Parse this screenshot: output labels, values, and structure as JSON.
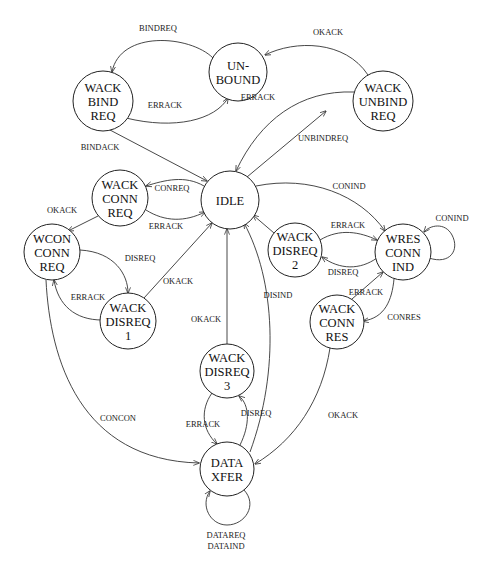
{
  "diagram": {
    "title": "",
    "type": "state-transition",
    "nodes": [
      {
        "id": "unbound",
        "lines": [
          "UN-",
          "BOUND"
        ],
        "cx": 238,
        "cy": 72,
        "r": 29
      },
      {
        "id": "wack_bind_req",
        "lines": [
          "WACK",
          "BIND",
          "REQ"
        ],
        "cx": 103,
        "cy": 101,
        "r": 30
      },
      {
        "id": "wack_unbind_req",
        "lines": [
          "WACK",
          "UNBIND",
          "REQ"
        ],
        "cx": 383,
        "cy": 101,
        "r": 30
      },
      {
        "id": "idle",
        "lines": [
          "IDLE"
        ],
        "cx": 230,
        "cy": 200,
        "r": 29
      },
      {
        "id": "wack_conn_req",
        "lines": [
          "WACK",
          "CONN",
          "REQ"
        ],
        "cx": 120,
        "cy": 198,
        "r": 28
      },
      {
        "id": "wcon_conn_req",
        "lines": [
          "WCON",
          "CONN",
          "REQ"
        ],
        "cx": 52,
        "cy": 252,
        "r": 28
      },
      {
        "id": "wack_disreq_1",
        "lines": [
          "WACK",
          "DISREQ",
          "1"
        ],
        "cx": 128,
        "cy": 321,
        "r": 28
      },
      {
        "id": "wack_disreq_2",
        "lines": [
          "WACK",
          "DISREQ",
          "2"
        ],
        "cx": 295,
        "cy": 250,
        "r": 27
      },
      {
        "id": "wres_conn_ind",
        "lines": [
          "WRES",
          "CONN",
          "IND"
        ],
        "cx": 403,
        "cy": 252,
        "r": 28
      },
      {
        "id": "wack_conn_res",
        "lines": [
          "WACK",
          "CONN",
          "RES"
        ],
        "cx": 337,
        "cy": 322,
        "r": 27
      },
      {
        "id": "wack_disreq_3",
        "lines": [
          "WACK",
          "DISREQ",
          "3"
        ],
        "cx": 227,
        "cy": 371,
        "r": 27
      },
      {
        "id": "data_xfer",
        "lines": [
          "DATA",
          "XFER"
        ],
        "cx": 227,
        "cy": 469,
        "r": 27
      }
    ],
    "edges": [
      {
        "from": "unbound",
        "to": "wack_bind_req",
        "label": "BINDREQ",
        "d": "M 213 58 C 190 35, 120 30, 112 72",
        "lx": 158,
        "ly": 31
      },
      {
        "from": "wack_bind_req",
        "to": "unbound",
        "label": "ERRACK",
        "d": "M 126 118 C 175 130, 215 120, 228 98",
        "lx": 165,
        "ly": 108
      },
      {
        "from": "wack_bind_req",
        "to": "idle",
        "label": "BINDACK",
        "d": "M 110 130 L 207 181",
        "lx": 100,
        "ly": 150
      },
      {
        "from": "wack_unbind_req",
        "to": "unbound",
        "label": "OKACK",
        "d": "M 368 75 C 345 40, 295 40, 265 55",
        "lx": 328,
        "ly": 35
      },
      {
        "from": "wack_unbind_req",
        "to": "idle",
        "label": "ERRACK",
        "d": "M 354 92 C 300 90, 260 120, 236 171",
        "lx": 258,
        "ly": 100
      },
      {
        "from": "idle",
        "to": "wack_unbind_req",
        "label": "UNBINDREQ",
        "d": "M 247 177 L 326 111",
        "lx": 323,
        "ly": 141
      },
      {
        "from": "idle",
        "to": "wack_conn_req",
        "label": "CONREQ",
        "d": "M 204 186 C 185 175, 165 180, 146 186",
        "lx": 172,
        "ly": 191
      },
      {
        "from": "wack_conn_req",
        "to": "idle",
        "label": "ERRACK",
        "d": "M 146 210 C 165 222, 185 222, 205 212",
        "lx": 166,
        "ly": 229
      },
      {
        "from": "wack_conn_req",
        "to": "wcon_conn_req",
        "label": "OKACK",
        "d": "M 98 216 L 68 231",
        "lx": 62,
        "ly": 213
      },
      {
        "from": "wcon_conn_req",
        "to": "wack_disreq_1",
        "label": "DISREQ",
        "d": "M 80 250 C 115 252, 128 275, 128 293",
        "lx": 140,
        "ly": 261
      },
      {
        "from": "wack_disreq_1",
        "to": "wcon_conn_req",
        "label": "ERRACK",
        "d": "M 102 320 C 75 320, 58 305, 54 280",
        "lx": 88,
        "ly": 300
      },
      {
        "from": "wack_disreq_1",
        "to": "idle",
        "label": "OKACK",
        "d": "M 144 298 L 212 223",
        "lx": 178,
        "ly": 284
      },
      {
        "from": "wack_disreq_3",
        "to": "idle",
        "label": "OKACK",
        "d": "M 227 344 L 227 229",
        "lx": 206,
        "ly": 322
      },
      {
        "from": "data_xfer",
        "to": "idle",
        "label": "DISIND",
        "d": "M 250 452 C 280 370, 275 280, 244 223",
        "lx": 278,
        "ly": 298
      },
      {
        "from": "idle",
        "to": "wres_conn_ind",
        "label": "CONIND",
        "d": "M 256 186 C 310 175, 360 195, 385 231",
        "lx": 349,
        "ly": 189
      },
      {
        "from": "wack_disreq_2",
        "to": "idle",
        "label": "",
        "d": "M 274 233 L 253 215",
        "lx": 0,
        "ly": 0
      },
      {
        "from": "wack_disreq_2",
        "to": "wres_conn_ind",
        "label": "ERRACK",
        "d": "M 320 240 C 340 228, 360 232, 377 240",
        "lx": 348,
        "ly": 228
      },
      {
        "from": "wres_conn_ind",
        "to": "wack_disreq_2",
        "label": "DISREQ",
        "d": "M 377 258 C 360 270, 340 270, 322 257",
        "lx": 343,
        "ly": 275
      },
      {
        "from": "wres_conn_ind",
        "to": "wres_conn_ind",
        "label": "CONIND",
        "d": "M 429 258 C 450 265, 460 250, 452 235 C 445 222, 430 225, 424 232",
        "lx": 452,
        "ly": 221
      },
      {
        "from": "wres_conn_ind",
        "to": "wack_conn_res",
        "label": "CONRES",
        "d": "M 394 279 C 392 300, 385 318, 363 321",
        "lx": 404,
        "ly": 320
      },
      {
        "from": "wack_conn_res",
        "to": "wres_conn_ind",
        "label": "ERRACK",
        "d": "M 352 299 L 383 272",
        "lx": 366,
        "ly": 295
      },
      {
        "from": "wack_conn_res",
        "to": "data_xfer",
        "label": "OKACK",
        "d": "M 330 348 C 322 400, 295 440, 255 464",
        "lx": 343,
        "ly": 418
      },
      {
        "from": "wcon_conn_req",
        "to": "data_xfer",
        "label": "CONCON",
        "d": "M 46 280 C 50 360, 80 460, 199 463",
        "lx": 118,
        "ly": 421
      },
      {
        "from": "data_xfer",
        "to": "wack_disreq_3",
        "label": "DISREQ",
        "d": "M 240 445 C 250 425, 250 405, 239 396",
        "lx": 256,
        "ly": 416
      },
      {
        "from": "wack_disreq_3",
        "to": "data_xfer",
        "label": "ERRACK",
        "d": "M 212 393 C 200 410, 202 430, 217 444",
        "lx": 203,
        "ly": 427
      },
      {
        "from": "data_xfer",
        "to": "data_xfer",
        "label": "DATAREQ",
        "label2": "DATAIND",
        "d": "M 244 490 C 258 505, 245 525, 227 525 C 210 525, 200 505, 210 491",
        "lx": 226,
        "ly": 538,
        "ly2": 549
      }
    ]
  }
}
